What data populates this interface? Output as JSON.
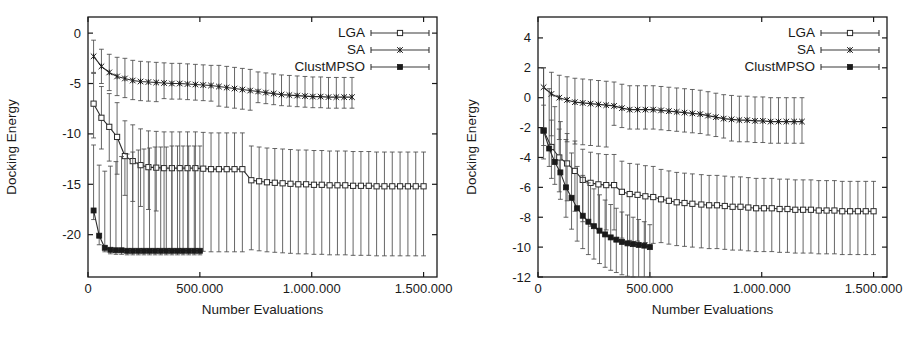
{
  "figure": {
    "title": "",
    "panel_count": 2
  },
  "chart_data": [
    {
      "type": "line",
      "panel": "left",
      "title": "",
      "xlabel": "Number Evaluations",
      "ylabel": "Docking Energy",
      "xlim": [
        0,
        1560000
      ],
      "ylim": [
        -24.2,
        1.6
      ],
      "xticks": [
        0,
        500000,
        1000000,
        1500000
      ],
      "xticklabels": [
        "0",
        "500.000",
        "1.000.000",
        "1.500.000"
      ],
      "yticks": [
        0,
        -5,
        -10,
        -15,
        -20
      ],
      "yticklabels": [
        "0",
        "-5",
        "-10",
        "-15",
        "-20"
      ],
      "grid": false,
      "legend_position": "top-right",
      "series": [
        {
          "name": "LGA",
          "marker": "open-square",
          "x": [
            25000,
            60000,
            95000,
            130000,
            165000,
            200000,
            235000,
            270000,
            305000,
            340000,
            375000,
            410000,
            445000,
            480000,
            515000,
            550000,
            585000,
            620000,
            655000,
            690000,
            730000,
            765000,
            800000,
            835000,
            870000,
            905000,
            940000,
            975000,
            1010000,
            1045000,
            1080000,
            1115000,
            1150000,
            1185000,
            1220000,
            1255000,
            1290000,
            1325000,
            1360000,
            1395000,
            1430000,
            1465000,
            1500000
          ],
          "values": [
            -7.0,
            -8.4,
            -9.3,
            -10.3,
            -12.2,
            -12.7,
            -13.1,
            -13.3,
            -13.35,
            -13.4,
            -13.4,
            -13.4,
            -13.4,
            -13.4,
            -13.45,
            -13.5,
            -13.5,
            -13.5,
            -13.5,
            -13.5,
            -14.6,
            -14.7,
            -14.8,
            -14.85,
            -14.9,
            -14.95,
            -15.0,
            -15.0,
            -15.05,
            -15.05,
            -15.1,
            -15.1,
            -15.1,
            -15.15,
            -15.15,
            -15.15,
            -15.2,
            -15.2,
            -15.2,
            -15.2,
            -15.2,
            -15.2,
            -15.2
          ],
          "err_low": [
            3.4,
            3.1,
            3.4,
            3.7,
            3.9,
            4.0,
            4.1,
            4.2,
            4.3,
            8.2,
            8.2,
            8.2,
            8.2,
            8.2,
            8.2,
            8.2,
            8.2,
            8.2,
            8.2,
            8.2,
            6.9,
            6.9,
            6.9,
            6.9,
            6.9,
            6.9,
            6.9,
            6.9,
            6.9,
            6.9,
            6.9,
            6.9,
            6.9,
            6.9,
            6.9,
            6.9,
            6.9,
            6.9,
            6.9,
            6.9,
            6.9,
            6.9,
            6.9
          ],
          "err_high": [
            3.0,
            3.1,
            3.3,
            3.4,
            3.5,
            3.6,
            3.6,
            3.6,
            3.6,
            3.6,
            3.6,
            3.6,
            3.6,
            3.6,
            3.6,
            3.6,
            3.6,
            3.6,
            3.6,
            3.6,
            3.4,
            3.4,
            3.4,
            3.4,
            3.4,
            3.4,
            3.4,
            3.4,
            3.4,
            3.4,
            3.4,
            3.4,
            3.4,
            3.4,
            3.4,
            3.4,
            3.4,
            3.4,
            3.4,
            3.4,
            3.4,
            3.4,
            3.4
          ]
        },
        {
          "name": "SA",
          "marker": "cross",
          "x": [
            25000,
            60000,
            95000,
            130000,
            165000,
            200000,
            235000,
            270000,
            305000,
            340000,
            375000,
            410000,
            445000,
            480000,
            515000,
            550000,
            585000,
            620000,
            655000,
            690000,
            725000,
            760000,
            795000,
            830000,
            865000,
            900000,
            935000,
            970000,
            1005000,
            1040000,
            1075000,
            1110000,
            1145000,
            1180000
          ],
          "values": [
            -2.3,
            -3.3,
            -3.9,
            -4.3,
            -4.5,
            -4.7,
            -4.8,
            -4.85,
            -4.9,
            -4.95,
            -5.0,
            -5.0,
            -5.05,
            -5.1,
            -5.15,
            -5.2,
            -5.3,
            -5.4,
            -5.5,
            -5.6,
            -5.7,
            -5.8,
            -5.9,
            -6.0,
            -6.1,
            -6.15,
            -6.2,
            -6.25,
            -6.3,
            -6.3,
            -6.35,
            -6.35,
            -6.35,
            -6.35
          ],
          "err_low": [
            1.6,
            1.7,
            1.8,
            1.9,
            1.9,
            1.9,
            1.9,
            1.9,
            1.9,
            1.55,
            1.55,
            1.55,
            1.55,
            1.55,
            1.55,
            1.55,
            1.95,
            1.95,
            1.95,
            1.95,
            1.95,
            1.1,
            1.1,
            1.1,
            1.1,
            1.1,
            1.1,
            1.1,
            1.1,
            1.1,
            1.1,
            1.1,
            1.1,
            1.1
          ],
          "err_high": [
            1.6,
            1.7,
            1.8,
            1.9,
            2.0,
            2.0,
            2.0,
            2.0,
            2.0,
            2.0,
            2.0,
            2.0,
            2.0,
            2.0,
            2.0,
            2.0,
            2.1,
            2.1,
            2.1,
            2.1,
            2.1,
            1.95,
            1.95,
            1.95,
            1.95,
            1.95,
            1.95,
            1.95,
            1.95,
            1.95,
            1.95,
            1.95,
            1.95,
            1.95
          ]
        },
        {
          "name": "ClustMPSO",
          "marker": "filled-square",
          "x": [
            25000,
            50000,
            75000,
            100000,
            125000,
            150000,
            175000,
            200000,
            225000,
            250000,
            275000,
            300000,
            325000,
            350000,
            375000,
            400000,
            425000,
            450000,
            475000,
            500000
          ],
          "values": [
            -17.6,
            -20.1,
            -21.3,
            -21.5,
            -21.55,
            -21.55,
            -21.6,
            -21.6,
            -21.6,
            -21.6,
            -21.6,
            -21.6,
            -21.6,
            -21.6,
            -21.6,
            -21.6,
            -21.6,
            -21.6,
            -21.6,
            -21.6
          ],
          "err_low": [
            0.9,
            0.9,
            0.4,
            0.4,
            0.4,
            0.4,
            0.4,
            0.4,
            0.4,
            0.4,
            0.4,
            0.4,
            0.4,
            0.4,
            0.4,
            0.4,
            0.4,
            0.4,
            0.4,
            0.4
          ],
          "err_high": [
            6.5,
            7.0,
            7.6,
            8.3,
            8.8,
            9.3,
            9.6,
            9.8,
            10.0,
            10.1,
            10.2,
            10.3,
            10.3,
            10.3,
            10.4,
            10.4,
            10.4,
            10.4,
            10.4,
            10.4
          ]
        }
      ]
    },
    {
      "type": "line",
      "panel": "right",
      "title": "",
      "xlabel": "Number Evaluations",
      "ylabel": "Docking Energy",
      "xlim": [
        0,
        1560000
      ],
      "ylim": [
        -12.0,
        5.4
      ],
      "xticks": [
        0,
        500000,
        1000000,
        1500000
      ],
      "xticklabels": [
        "0",
        "500.000",
        "1.000.000",
        "1.500.000"
      ],
      "yticks": [
        4,
        2,
        0,
        -2,
        -4,
        -6,
        -8,
        -10,
        -12
      ],
      "yticklabels": [
        "4",
        "2",
        "0",
        "-2",
        "-4",
        "-6",
        "-8",
        "-10",
        "-12"
      ],
      "grid": false,
      "legend_position": "top-right",
      "series": [
        {
          "name": "LGA",
          "marker": "open-square",
          "x": [
            25000,
            60000,
            95000,
            130000,
            165000,
            200000,
            235000,
            270000,
            305000,
            340000,
            375000,
            410000,
            445000,
            480000,
            515000,
            550000,
            585000,
            620000,
            655000,
            690000,
            730000,
            765000,
            800000,
            835000,
            870000,
            905000,
            940000,
            975000,
            1010000,
            1045000,
            1080000,
            1115000,
            1150000,
            1185000,
            1220000,
            1255000,
            1290000,
            1325000,
            1360000,
            1395000,
            1430000,
            1465000,
            1500000
          ],
          "values": [
            -2.2,
            -3.3,
            -4.0,
            -4.4,
            -4.9,
            -5.5,
            -5.7,
            -5.8,
            -5.85,
            -5.85,
            -6.3,
            -6.45,
            -6.5,
            -6.6,
            -6.65,
            -6.8,
            -6.9,
            -7.0,
            -7.05,
            -7.1,
            -7.15,
            -7.2,
            -7.2,
            -7.25,
            -7.3,
            -7.3,
            -7.35,
            -7.4,
            -7.4,
            -7.4,
            -7.45,
            -7.45,
            -7.5,
            -7.5,
            -7.5,
            -7.55,
            -7.55,
            -7.55,
            -7.6,
            -7.6,
            -7.6,
            -7.6,
            -7.6
          ],
          "err_low": [
            1.9,
            2.1,
            2.3,
            2.5,
            2.7,
            2.8,
            2.9,
            3.0,
            3.0,
            3.0,
            3.1,
            3.1,
            3.1,
            3.1,
            3.1,
            2.9,
            2.9,
            2.9,
            2.9,
            2.9,
            2.9,
            2.9,
            2.9,
            2.9,
            2.9,
            2.9,
            2.9,
            2.9,
            2.9,
            2.9,
            2.9,
            2.9,
            2.9,
            2.9,
            2.9,
            2.9,
            2.9,
            2.9,
            2.9,
            2.9,
            2.9,
            2.9,
            2.9
          ],
          "err_high": [
            1.7,
            1.8,
            1.9,
            2.0,
            2.0,
            2.05,
            2.05,
            2.05,
            2.05,
            2.05,
            2.05,
            2.05,
            2.05,
            2.05,
            2.05,
            2.0,
            2.0,
            2.0,
            2.0,
            2.0,
            2.0,
            2.0,
            2.0,
            2.0,
            2.0,
            2.0,
            2.0,
            2.0,
            2.0,
            2.0,
            2.0,
            2.0,
            2.0,
            2.0,
            2.0,
            2.0,
            2.0,
            2.0,
            2.0,
            2.0,
            2.0,
            2.0,
            2.0
          ]
        },
        {
          "name": "SA",
          "marker": "cross",
          "x": [
            25000,
            60000,
            95000,
            130000,
            165000,
            200000,
            235000,
            270000,
            305000,
            340000,
            375000,
            410000,
            445000,
            480000,
            515000,
            550000,
            585000,
            620000,
            655000,
            690000,
            725000,
            760000,
            795000,
            830000,
            865000,
            900000,
            935000,
            970000,
            1005000,
            1040000,
            1075000,
            1110000,
            1145000,
            1180000
          ],
          "values": [
            0.7,
            0.25,
            0.0,
            -0.15,
            -0.3,
            -0.35,
            -0.4,
            -0.45,
            -0.5,
            -0.55,
            -0.7,
            -0.8,
            -0.8,
            -0.8,
            -0.8,
            -0.85,
            -0.9,
            -0.95,
            -1.0,
            -1.05,
            -1.1,
            -1.2,
            -1.3,
            -1.4,
            -1.45,
            -1.5,
            -1.5,
            -1.55,
            -1.55,
            -1.6,
            -1.6,
            -1.6,
            -1.6,
            -1.6
          ],
          "err_low": [
            2.8,
            2.8,
            2.8,
            2.8,
            2.8,
            2.8,
            2.8,
            2.8,
            2.8,
            1.3,
            1.3,
            1.3,
            1.3,
            1.3,
            1.3,
            1.3,
            1.3,
            1.3,
            1.3,
            1.3,
            1.3,
            1.3,
            1.3,
            1.3,
            1.45,
            1.45,
            1.45,
            1.45,
            1.45,
            1.45,
            1.45,
            1.45,
            1.45,
            1.45
          ],
          "err_high": [
            1.3,
            1.45,
            1.5,
            1.55,
            1.6,
            1.6,
            1.6,
            1.6,
            1.6,
            1.6,
            1.6,
            1.6,
            1.6,
            1.6,
            1.6,
            1.6,
            1.6,
            1.6,
            1.6,
            1.6,
            1.6,
            1.6,
            1.6,
            1.6,
            1.6,
            1.6,
            1.6,
            1.6,
            1.6,
            1.6,
            1.6,
            1.6,
            1.6,
            1.6
          ]
        },
        {
          "name": "ClustMPSO",
          "marker": "filled-square",
          "x": [
            25000,
            50000,
            75000,
            100000,
            125000,
            150000,
            175000,
            200000,
            225000,
            250000,
            275000,
            300000,
            325000,
            350000,
            375000,
            400000,
            425000,
            450000,
            475000,
            500000
          ],
          "values": [
            -2.2,
            -3.4,
            -4.3,
            -5.0,
            -6.0,
            -6.7,
            -7.4,
            -7.9,
            -8.3,
            -8.6,
            -8.9,
            -9.15,
            -9.35,
            -9.5,
            -9.65,
            -9.75,
            -9.8,
            -9.85,
            -9.9,
            -10.0
          ],
          "err_low": [
            1.0,
            1.2,
            1.5,
            1.8,
            2.0,
            2.1,
            2.2,
            2.2,
            2.2,
            2.2,
            2.2,
            2.2,
            2.2,
            2.2,
            2.2,
            2.2,
            2.2,
            2.2,
            2.2,
            2.0
          ],
          "err_high": [
            4.2,
            4.0,
            3.7,
            3.4,
            3.2,
            3.0,
            2.8,
            2.7,
            2.6,
            2.5,
            2.4,
            2.3,
            2.2,
            2.1,
            2.0,
            1.9,
            1.8,
            1.7,
            1.6,
            1.5
          ]
        }
      ]
    }
  ]
}
